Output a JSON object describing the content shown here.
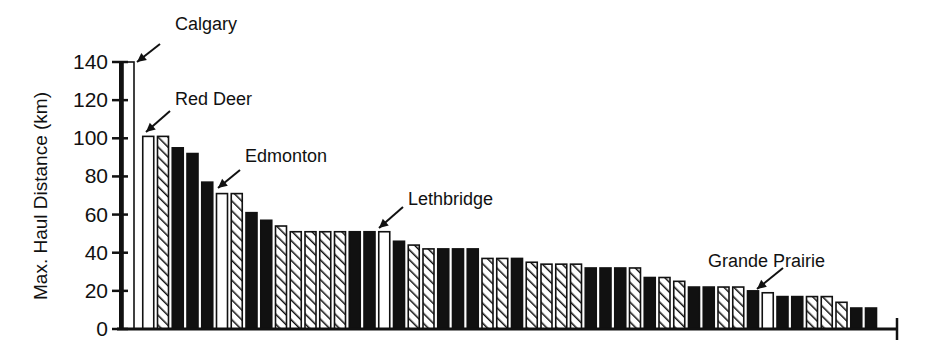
{
  "chart_data": {
    "type": "bar",
    "title": "",
    "xlabel": "",
    "ylabel": "Max. Haul Distance (km)",
    "ylim": [
      0,
      140
    ],
    "yticks": [
      0,
      20,
      40,
      60,
      80,
      100,
      120,
      140
    ],
    "grid": false,
    "legend": null,
    "pattern_key": {
      "white": "open (unfilled) bar — labeled cities",
      "hatched": "diagonal-hatched bar",
      "black": "solid black bar"
    },
    "bars": [
      {
        "index": 1,
        "pattern": "white",
        "value": 140,
        "label": "Calgary"
      },
      {
        "index": 2,
        "pattern": "white",
        "value": 101,
        "label": "Red Deer"
      },
      {
        "index": 3,
        "pattern": "hatched",
        "value": 101
      },
      {
        "index": 4,
        "pattern": "black",
        "value": 95
      },
      {
        "index": 5,
        "pattern": "black",
        "value": 92
      },
      {
        "index": 6,
        "pattern": "black",
        "value": 77
      },
      {
        "index": 7,
        "pattern": "white",
        "value": 71,
        "label": "Edmonton"
      },
      {
        "index": 8,
        "pattern": "hatched",
        "value": 71
      },
      {
        "index": 9,
        "pattern": "black",
        "value": 61
      },
      {
        "index": 10,
        "pattern": "black",
        "value": 57
      },
      {
        "index": 11,
        "pattern": "hatched",
        "value": 54
      },
      {
        "index": 12,
        "pattern": "hatched",
        "value": 51
      },
      {
        "index": 13,
        "pattern": "hatched",
        "value": 51
      },
      {
        "index": 14,
        "pattern": "hatched",
        "value": 51
      },
      {
        "index": 15,
        "pattern": "hatched",
        "value": 51
      },
      {
        "index": 16,
        "pattern": "black",
        "value": 51
      },
      {
        "index": 17,
        "pattern": "black",
        "value": 51
      },
      {
        "index": 18,
        "pattern": "white",
        "value": 51,
        "label": "Lethbridge"
      },
      {
        "index": 19,
        "pattern": "black",
        "value": 46
      },
      {
        "index": 20,
        "pattern": "hatched",
        "value": 44
      },
      {
        "index": 21,
        "pattern": "hatched",
        "value": 42
      },
      {
        "index": 22,
        "pattern": "black",
        "value": 42
      },
      {
        "index": 23,
        "pattern": "black",
        "value": 42
      },
      {
        "index": 24,
        "pattern": "black",
        "value": 42
      },
      {
        "index": 25,
        "pattern": "hatched",
        "value": 37
      },
      {
        "index": 26,
        "pattern": "hatched",
        "value": 37
      },
      {
        "index": 27,
        "pattern": "black",
        "value": 37
      },
      {
        "index": 28,
        "pattern": "hatched",
        "value": 35
      },
      {
        "index": 29,
        "pattern": "hatched",
        "value": 34
      },
      {
        "index": 30,
        "pattern": "hatched",
        "value": 34
      },
      {
        "index": 31,
        "pattern": "hatched",
        "value": 34
      },
      {
        "index": 32,
        "pattern": "black",
        "value": 32
      },
      {
        "index": 33,
        "pattern": "black",
        "value": 32
      },
      {
        "index": 34,
        "pattern": "black",
        "value": 32
      },
      {
        "index": 35,
        "pattern": "hatched",
        "value": 32
      },
      {
        "index": 36,
        "pattern": "black",
        "value": 27
      },
      {
        "index": 37,
        "pattern": "hatched",
        "value": 27
      },
      {
        "index": 38,
        "pattern": "hatched",
        "value": 25
      },
      {
        "index": 39,
        "pattern": "black",
        "value": 22
      },
      {
        "index": 40,
        "pattern": "black",
        "value": 22
      },
      {
        "index": 41,
        "pattern": "hatched",
        "value": 22
      },
      {
        "index": 42,
        "pattern": "hatched",
        "value": 22
      },
      {
        "index": 43,
        "pattern": "black",
        "value": 20
      },
      {
        "index": 44,
        "pattern": "white",
        "value": 19,
        "label": "Grande Prairie"
      },
      {
        "index": 45,
        "pattern": "black",
        "value": 17
      },
      {
        "index": 46,
        "pattern": "black",
        "value": 17
      },
      {
        "index": 47,
        "pattern": "hatched",
        "value": 17
      },
      {
        "index": 48,
        "pattern": "hatched",
        "value": 17
      },
      {
        "index": 49,
        "pattern": "hatched",
        "value": 14
      },
      {
        "index": 50,
        "pattern": "black",
        "value": 11
      },
      {
        "index": 51,
        "pattern": "black",
        "value": 11
      }
    ],
    "annotations": [
      {
        "text": "Calgary",
        "bar_index": 1,
        "label_x": 175,
        "label_y": 30,
        "arrow_from": [
          160,
          44
        ],
        "arrow_to": [
          137,
          62
        ]
      },
      {
        "text": "Red Deer",
        "bar_index": 2,
        "label_x": 175,
        "label_y": 105,
        "arrow_from": [
          170,
          111
        ],
        "arrow_to": [
          146,
          132
        ]
      },
      {
        "text": "Edmonton",
        "bar_index": 7,
        "label_x": 245,
        "label_y": 162,
        "arrow_from": [
          240,
          170
        ],
        "arrow_to": [
          218,
          188
        ]
      },
      {
        "text": "Lethbridge",
        "bar_index": 18,
        "label_x": 408,
        "label_y": 205,
        "arrow_from": [
          403,
          207
        ],
        "arrow_to": [
          379,
          228
        ]
      },
      {
        "text": "Grande Prairie",
        "bar_index": 44,
        "label_x": 708,
        "label_y": 267,
        "arrow_from": [
          783,
          268
        ],
        "arrow_to": [
          757,
          289
        ]
      }
    ]
  },
  "colors": {
    "ink": "#111111",
    "background": "#ffffff"
  }
}
